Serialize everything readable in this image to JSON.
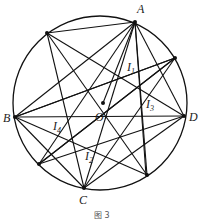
{
  "figure": {
    "caption": "图 3",
    "circle": {
      "cx": 100,
      "cy": 103,
      "r": 87
    },
    "center": {
      "name": "O",
      "x": 103,
      "y": 103
    },
    "points": {
      "A": {
        "x": 135,
        "y": 22
      },
      "P1": {
        "x": 47,
        "y": 33
      },
      "P2": {
        "x": 175,
        "y": 58
      },
      "B": {
        "x": 15,
        "y": 117
      },
      "D": {
        "x": 184,
        "y": 116
      },
      "P3": {
        "x": 39,
        "y": 164
      },
      "C": {
        "x": 84,
        "y": 188
      },
      "P4": {
        "x": 147,
        "y": 175
      }
    },
    "labels": [
      {
        "text": "A",
        "x": 137,
        "y": 13
      },
      {
        "text": "B",
        "x": 3,
        "y": 122
      },
      {
        "text": "C",
        "x": 79,
        "y": 204
      },
      {
        "text": "D",
        "x": 189,
        "y": 121
      },
      {
        "text": "O",
        "x": 95,
        "y": 121
      },
      {
        "text": "I",
        "sub": "1",
        "x": 127,
        "y": 71
      },
      {
        "text": "I",
        "sub": "2",
        "x": 85,
        "y": 160
      },
      {
        "text": "I",
        "sub": "3",
        "x": 146,
        "y": 108
      },
      {
        "text": "I",
        "sub": "4",
        "x": 53,
        "y": 130
      }
    ]
  }
}
